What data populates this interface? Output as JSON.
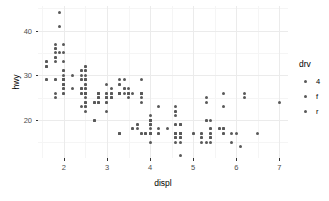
{
  "chart_data": {
    "type": "scatter",
    "title": "",
    "xlabel": "displ",
    "ylabel": "hwy",
    "xlim": [
      1.4,
      7.2
    ],
    "ylim": [
      11.5,
      45.5
    ],
    "grid": true,
    "legend": {
      "title": "drv",
      "position": "right",
      "entries": [
        {
          "label": "4"
        },
        {
          "label": "f"
        },
        {
          "label": "r"
        }
      ]
    },
    "xticks": [
      {
        "value": 2,
        "label": "2"
      },
      {
        "value": 3,
        "label": "3"
      },
      {
        "value": 4,
        "label": "4"
      },
      {
        "value": 5,
        "label": "5"
      },
      {
        "value": 6,
        "label": "6"
      },
      {
        "value": 7,
        "label": "7"
      }
    ],
    "yticks": [
      {
        "value": 20,
        "label": "20"
      },
      {
        "value": 30,
        "label": "30"
      },
      {
        "value": 40,
        "label": "40"
      }
    ],
    "x_minor_ticks": [
      1.5,
      2.5,
      3.5,
      4.5,
      5.5,
      6.5
    ],
    "y_minor_ticks": [
      15,
      25,
      35,
      45
    ],
    "point_color": "#595959",
    "point_size": 3,
    "points": [
      {
        "x": 1.8,
        "y": 29
      },
      {
        "x": 1.8,
        "y": 29
      },
      {
        "x": 2.0,
        "y": 31
      },
      {
        "x": 2.0,
        "y": 30
      },
      {
        "x": 2.8,
        "y": 26
      },
      {
        "x": 2.8,
        "y": 26
      },
      {
        "x": 3.1,
        "y": 27
      },
      {
        "x": 1.8,
        "y": 26
      },
      {
        "x": 1.8,
        "y": 25
      },
      {
        "x": 2.0,
        "y": 28
      },
      {
        "x": 2.0,
        "y": 27
      },
      {
        "x": 2.8,
        "y": 25
      },
      {
        "x": 2.8,
        "y": 25
      },
      {
        "x": 3.1,
        "y": 25
      },
      {
        "x": 3.1,
        "y": 25
      },
      {
        "x": 2.8,
        "y": 24
      },
      {
        "x": 3.1,
        "y": 25
      },
      {
        "x": 4.2,
        "y": 23
      },
      {
        "x": 5.3,
        "y": 20
      },
      {
        "x": 5.3,
        "y": 15
      },
      {
        "x": 5.3,
        "y": 20
      },
      {
        "x": 5.7,
        "y": 17
      },
      {
        "x": 6.0,
        "y": 17
      },
      {
        "x": 5.7,
        "y": 26
      },
      {
        "x": 5.7,
        "y": 23
      },
      {
        "x": 6.2,
        "y": 26
      },
      {
        "x": 6.2,
        "y": 25
      },
      {
        "x": 7.0,
        "y": 24
      },
      {
        "x": 5.3,
        "y": 25
      },
      {
        "x": 5.3,
        "y": 24
      },
      {
        "x": 5.7,
        "y": 18
      },
      {
        "x": 6.5,
        "y": 17
      },
      {
        "x": 2.4,
        "y": 26
      },
      {
        "x": 2.4,
        "y": 23
      },
      {
        "x": 3.1,
        "y": 26
      },
      {
        "x": 3.5,
        "y": 26
      },
      {
        "x": 3.6,
        "y": 26
      },
      {
        "x": 2.4,
        "y": 31
      },
      {
        "x": 3.0,
        "y": 26
      },
      {
        "x": 3.3,
        "y": 26
      },
      {
        "x": 3.3,
        "y": 26
      },
      {
        "x": 3.3,
        "y": 26
      },
      {
        "x": 3.3,
        "y": 26
      },
      {
        "x": 3.3,
        "y": 26
      },
      {
        "x": 3.8,
        "y": 26
      },
      {
        "x": 3.8,
        "y": 26
      },
      {
        "x": 3.8,
        "y": 26
      },
      {
        "x": 4.0,
        "y": 19
      },
      {
        "x": 3.7,
        "y": 19
      },
      {
        "x": 3.7,
        "y": 18
      },
      {
        "x": 3.9,
        "y": 17
      },
      {
        "x": 3.9,
        "y": 17
      },
      {
        "x": 4.7,
        "y": 16
      },
      {
        "x": 4.7,
        "y": 16
      },
      {
        "x": 4.7,
        "y": 17
      },
      {
        "x": 5.2,
        "y": 17
      },
      {
        "x": 5.2,
        "y": 15
      },
      {
        "x": 3.9,
        "y": 17
      },
      {
        "x": 4.7,
        "y": 17
      },
      {
        "x": 4.7,
        "y": 15
      },
      {
        "x": 4.7,
        "y": 17
      },
      {
        "x": 5.2,
        "y": 17
      },
      {
        "x": 5.7,
        "y": 18
      },
      {
        "x": 5.9,
        "y": 17
      },
      {
        "x": 4.7,
        "y": 19
      },
      {
        "x": 4.7,
        "y": 17
      },
      {
        "x": 4.7,
        "y": 19
      },
      {
        "x": 4.7,
        "y": 19
      },
      {
        "x": 4.7,
        "y": 17
      },
      {
        "x": 4.7,
        "y": 17
      },
      {
        "x": 5.2,
        "y": 16
      },
      {
        "x": 5.2,
        "y": 16
      },
      {
        "x": 5.7,
        "y": 17
      },
      {
        "x": 5.9,
        "y": 15
      },
      {
        "x": 4.6,
        "y": 17
      },
      {
        "x": 5.4,
        "y": 17
      },
      {
        "x": 5.4,
        "y": 18
      },
      {
        "x": 4.0,
        "y": 17
      },
      {
        "x": 4.0,
        "y": 19
      },
      {
        "x": 4.0,
        "y": 17
      },
      {
        "x": 4.0,
        "y": 19
      },
      {
        "x": 4.6,
        "y": 19
      },
      {
        "x": 5.0,
        "y": 17
      },
      {
        "x": 4.2,
        "y": 17
      },
      {
        "x": 4.2,
        "y": 17
      },
      {
        "x": 4.6,
        "y": 16
      },
      {
        "x": 4.6,
        "y": 16
      },
      {
        "x": 4.6,
        "y": 17
      },
      {
        "x": 5.4,
        "y": 15
      },
      {
        "x": 5.4,
        "y": 16
      },
      {
        "x": 3.8,
        "y": 17
      },
      {
        "x": 3.8,
        "y": 17
      },
      {
        "x": 4.0,
        "y": 18
      },
      {
        "x": 4.0,
        "y": 17
      },
      {
        "x": 4.6,
        "y": 17
      },
      {
        "x": 4.6,
        "y": 17
      },
      {
        "x": 4.6,
        "y": 17
      },
      {
        "x": 4.6,
        "y": 16
      },
      {
        "x": 5.4,
        "y": 16
      },
      {
        "x": 1.6,
        "y": 33
      },
      {
        "x": 1.6,
        "y": 32
      },
      {
        "x": 1.6,
        "y": 32
      },
      {
        "x": 1.6,
        "y": 29
      },
      {
        "x": 1.6,
        "y": 32
      },
      {
        "x": 1.8,
        "y": 34
      },
      {
        "x": 1.8,
        "y": 36
      },
      {
        "x": 1.8,
        "y": 36
      },
      {
        "x": 2.0,
        "y": 29
      },
      {
        "x": 2.4,
        "y": 26
      },
      {
        "x": 2.4,
        "y": 27
      },
      {
        "x": 2.4,
        "y": 30
      },
      {
        "x": 2.4,
        "y": 31
      },
      {
        "x": 2.5,
        "y": 26
      },
      {
        "x": 2.5,
        "y": 26
      },
      {
        "x": 3.3,
        "y": 28
      },
      {
        "x": 2.0,
        "y": 26
      },
      {
        "x": 2.0,
        "y": 29
      },
      {
        "x": 2.0,
        "y": 28
      },
      {
        "x": 2.0,
        "y": 27
      },
      {
        "x": 2.7,
        "y": 24
      },
      {
        "x": 2.7,
        "y": 24
      },
      {
        "x": 2.7,
        "y": 24
      },
      {
        "x": 3.0,
        "y": 22
      },
      {
        "x": 3.7,
        "y": 19
      },
      {
        "x": 4.0,
        "y": 20
      },
      {
        "x": 4.7,
        "y": 17
      },
      {
        "x": 4.7,
        "y": 12
      },
      {
        "x": 4.7,
        "y": 19
      },
      {
        "x": 5.7,
        "y": 18
      },
      {
        "x": 6.1,
        "y": 14
      },
      {
        "x": 4.0,
        "y": 15
      },
      {
        "x": 4.2,
        "y": 18
      },
      {
        "x": 4.4,
        "y": 18
      },
      {
        "x": 4.6,
        "y": 15
      },
      {
        "x": 5.4,
        "y": 17
      },
      {
        "x": 5.4,
        "y": 16
      },
      {
        "x": 5.4,
        "y": 18
      },
      {
        "x": 4.0,
        "y": 17
      },
      {
        "x": 4.0,
        "y": 19
      },
      {
        "x": 4.6,
        "y": 19
      },
      {
        "x": 5.0,
        "y": 17
      },
      {
        "x": 2.4,
        "y": 29
      },
      {
        "x": 2.4,
        "y": 27
      },
      {
        "x": 2.5,
        "y": 31
      },
      {
        "x": 2.5,
        "y": 32
      },
      {
        "x": 3.5,
        "y": 27
      },
      {
        "x": 3.5,
        "y": 26
      },
      {
        "x": 3.0,
        "y": 26
      },
      {
        "x": 3.0,
        "y": 25
      },
      {
        "x": 3.5,
        "y": 25
      },
      {
        "x": 3.3,
        "y": 17
      },
      {
        "x": 3.3,
        "y": 17
      },
      {
        "x": 4.0,
        "y": 20
      },
      {
        "x": 5.6,
        "y": 18
      },
      {
        "x": 3.1,
        "y": 26
      },
      {
        "x": 3.8,
        "y": 26
      },
      {
        "x": 3.8,
        "y": 25
      },
      {
        "x": 3.8,
        "y": 24
      },
      {
        "x": 4.0,
        "y": 21
      },
      {
        "x": 4.0,
        "y": 20
      },
      {
        "x": 4.0,
        "y": 20
      },
      {
        "x": 4.6,
        "y": 21
      },
      {
        "x": 4.6,
        "y": 22
      },
      {
        "x": 4.6,
        "y": 23
      },
      {
        "x": 4.6,
        "y": 22
      },
      {
        "x": 5.4,
        "y": 20
      },
      {
        "x": 1.6,
        "y": 33
      },
      {
        "x": 1.8,
        "y": 35
      },
      {
        "x": 1.8,
        "y": 37
      },
      {
        "x": 2.0,
        "y": 35
      },
      {
        "x": 1.9,
        "y": 44
      },
      {
        "x": 1.9,
        "y": 41
      },
      {
        "x": 2.0,
        "y": 33
      },
      {
        "x": 2.0,
        "y": 29
      },
      {
        "x": 2.5,
        "y": 28
      },
      {
        "x": 2.5,
        "y": 29
      },
      {
        "x": 2.8,
        "y": 26
      },
      {
        "x": 2.8,
        "y": 26
      },
      {
        "x": 3.3,
        "y": 26
      },
      {
        "x": 2.0,
        "y": 29
      },
      {
        "x": 2.0,
        "y": 29
      },
      {
        "x": 2.0,
        "y": 29
      },
      {
        "x": 2.0,
        "y": 29
      },
      {
        "x": 2.5,
        "y": 29
      },
      {
        "x": 2.5,
        "y": 29
      },
      {
        "x": 2.5,
        "y": 28
      },
      {
        "x": 2.5,
        "y": 29
      },
      {
        "x": 2.5,
        "y": 26
      },
      {
        "x": 2.5,
        "y": 26
      },
      {
        "x": 2.5,
        "y": 26
      },
      {
        "x": 2.5,
        "y": 24
      },
      {
        "x": 2.5,
        "y": 24
      },
      {
        "x": 2.5,
        "y": 23
      },
      {
        "x": 2.2,
        "y": 27
      },
      {
        "x": 2.2,
        "y": 30
      },
      {
        "x": 2.5,
        "y": 27
      },
      {
        "x": 2.5,
        "y": 27
      },
      {
        "x": 2.5,
        "y": 26
      },
      {
        "x": 2.5,
        "y": 26
      },
      {
        "x": 2.7,
        "y": 20
      },
      {
        "x": 2.7,
        "y": 20
      },
      {
        "x": 3.4,
        "y": 29
      },
      {
        "x": 3.4,
        "y": 27
      },
      {
        "x": 4.0,
        "y": 20
      },
      {
        "x": 4.0,
        "y": 20
      },
      {
        "x": 4.0,
        "y": 17
      },
      {
        "x": 4.0,
        "y": 17
      },
      {
        "x": 4.7,
        "y": 16
      },
      {
        "x": 1.6,
        "y": 29
      },
      {
        "x": 1.8,
        "y": 33
      },
      {
        "x": 1.8,
        "y": 34
      },
      {
        "x": 2.0,
        "y": 31
      },
      {
        "x": 2.4,
        "y": 29
      },
      {
        "x": 2.4,
        "y": 27
      },
      {
        "x": 2.5,
        "y": 30
      },
      {
        "x": 2.5,
        "y": 31
      },
      {
        "x": 3.5,
        "y": 26
      },
      {
        "x": 3.5,
        "y": 26
      },
      {
        "x": 3.0,
        "y": 28
      },
      {
        "x": 3.3,
        "y": 26
      },
      {
        "x": 3.3,
        "y": 29
      },
      {
        "x": 3.3,
        "y": 28
      },
      {
        "x": 4.0,
        "y": 20
      },
      {
        "x": 5.6,
        "y": 18
      },
      {
        "x": 3.1,
        "y": 26
      },
      {
        "x": 3.8,
        "y": 26
      },
      {
        "x": 3.8,
        "y": 29
      },
      {
        "x": 2.0,
        "y": 29
      },
      {
        "x": 2.0,
        "y": 29
      },
      {
        "x": 2.0,
        "y": 28
      },
      {
        "x": 2.0,
        "y": 29
      },
      {
        "x": 2.8,
        "y": 26
      },
      {
        "x": 1.9,
        "y": 35
      },
      {
        "x": 2.0,
        "y": 37
      },
      {
        "x": 2.5,
        "y": 32
      },
      {
        "x": 2.8,
        "y": 24
      },
      {
        "x": 2.8,
        "y": 24
      },
      {
        "x": 2.8,
        "y": 25
      },
      {
        "x": 3.6,
        "y": 18
      },
      {
        "x": 2.0,
        "y": 29
      },
      {
        "x": 2.0,
        "y": 28
      },
      {
        "x": 2.0,
        "y": 29
      },
      {
        "x": 2.0,
        "y": 26
      },
      {
        "x": 2.5,
        "y": 26
      },
      {
        "x": 2.5,
        "y": 26
      },
      {
        "x": 2.5,
        "y": 26
      },
      {
        "x": 2.5,
        "y": 26
      },
      {
        "x": 2.5,
        "y": 25
      },
      {
        "x": 2.5,
        "y": 24
      },
      {
        "x": 2.5,
        "y": 23
      },
      {
        "x": 2.5,
        "y": 22
      },
      {
        "x": 3.0,
        "y": 24
      },
      {
        "x": 3.0,
        "y": 24
      },
      {
        "x": 3.0,
        "y": 25
      },
      {
        "x": 3.0,
        "y": 25
      },
      {
        "x": 3.0,
        "y": 25
      },
      {
        "x": 3.3,
        "y": 17
      },
      {
        "x": 3.3,
        "y": 17
      },
      {
        "x": 3.4,
        "y": 26
      },
      {
        "x": 3.4,
        "y": 27
      },
      {
        "x": 3.6,
        "y": 18
      },
      {
        "x": 2.7,
        "y": 20
      }
    ]
  }
}
